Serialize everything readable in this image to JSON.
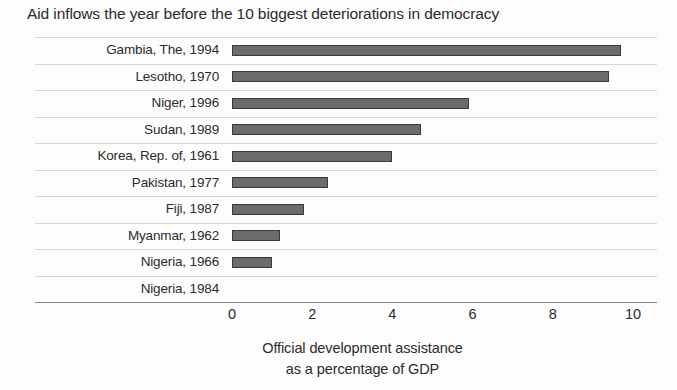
{
  "chart_data": {
    "type": "bar",
    "orientation": "horizontal",
    "title": "Aid inflows the year before the 10 biggest deteriorations in democracy",
    "xlabel_line1": "Official development assistance",
    "xlabel_line2": "as a percentage of GDP",
    "ylabel": "",
    "categories": [
      "Gambia, The, 1994",
      "Lesotho, 1970",
      "Niger, 1996",
      "Sudan, 1989",
      "Korea, Rep. of, 1961",
      "Pakistan, 1977",
      "Fiji, 1987",
      "Myanmar, 1962",
      "Nigeria, 1966",
      "Nigeria, 1984"
    ],
    "values": [
      9.7,
      9.4,
      5.9,
      4.7,
      4.0,
      2.4,
      1.8,
      1.2,
      1.0,
      0.0
    ],
    "xlim": [
      0,
      10
    ],
    "xticks": [
      0,
      2,
      4,
      6,
      8,
      10
    ],
    "xtick_labels": [
      "0",
      "2",
      "4",
      "6",
      "8",
      "10"
    ],
    "grid": "horizontal",
    "legend": "none",
    "bar_color": "#6b6b6b",
    "bar_border_color": "#3a3a3a",
    "gridline_color": "#c9c9c9",
    "axis_line_color": "#8a8a8a",
    "text_color": "#2b2b2b",
    "background_color": "#fdfdfd"
  }
}
